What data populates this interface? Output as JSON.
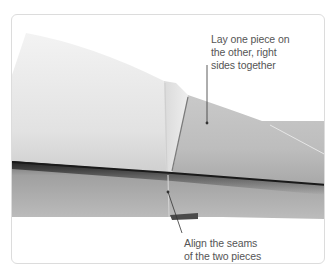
{
  "figure": {
    "colors": {
      "frame_border": "#dcdcdc",
      "background": "#ffffff",
      "fabric_light": "#ececec",
      "fabric_mid": "#c8c8c8",
      "fabric_dark": "#8a8a8a",
      "fold_shadow": "#2a2a2a",
      "leader_line": "#333333",
      "text": "#555555"
    }
  },
  "callouts": [
    {
      "id": "lay-pieces",
      "lines": [
        "Lay one piece on",
        "the other, right",
        "sides together"
      ]
    },
    {
      "id": "align-seams",
      "lines": [
        "Align the seams",
        "of the two pieces"
      ]
    }
  ]
}
